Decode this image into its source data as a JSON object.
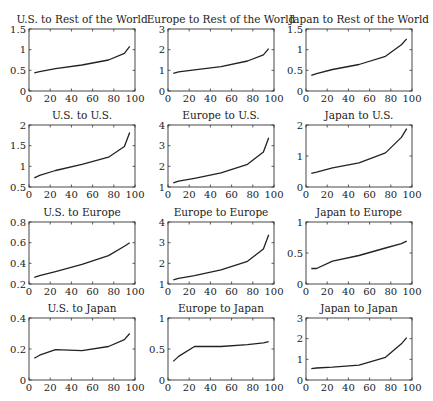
{
  "figure": {
    "layout": {
      "rows": 4,
      "cols": 3
    },
    "colors": {
      "line": "#222222",
      "axes": "#333333",
      "background": "#ffffff"
    }
  },
  "chart_data": [
    {
      "type": "line",
      "title": "U.S. to Rest of the World",
      "xlabel": "",
      "ylabel": "",
      "xlim": [
        0,
        100
      ],
      "ylim": [
        0,
        1.5
      ],
      "xticks": [
        0,
        20,
        40,
        60,
        80,
        100
      ],
      "yticks": [
        0,
        0.5,
        1,
        1.5
      ],
      "ytick_labels": [
        "0",
        "0.5",
        "1",
        "1.5"
      ],
      "grid": false,
      "x": [
        5,
        10,
        25,
        50,
        75,
        90,
        95
      ],
      "y": [
        0.44,
        0.47,
        0.54,
        0.63,
        0.75,
        0.91,
        1.08
      ]
    },
    {
      "type": "line",
      "title": "Europe to Rest of the World",
      "xlabel": "",
      "ylabel": "",
      "xlim": [
        0,
        100
      ],
      "ylim": [
        0,
        3
      ],
      "xticks": [
        0,
        20,
        40,
        60,
        80,
        100
      ],
      "yticks": [
        0,
        1,
        2,
        3
      ],
      "ytick_labels": [
        "0",
        "1",
        "2",
        "3"
      ],
      "grid": false,
      "x": [
        5,
        10,
        25,
        50,
        75,
        90,
        95
      ],
      "y": [
        0.85,
        0.93,
        1.02,
        1.18,
        1.45,
        1.75,
        2.05
      ]
    },
    {
      "type": "line",
      "title": "Japan to Rest of the World",
      "xlabel": "",
      "ylabel": "",
      "xlim": [
        0,
        100
      ],
      "ylim": [
        0,
        1.5
      ],
      "xticks": [
        0,
        20,
        40,
        60,
        80,
        100
      ],
      "yticks": [
        0,
        0.5,
        1,
        1.5
      ],
      "ytick_labels": [
        "0",
        "0.5",
        "1",
        "1.5"
      ],
      "grid": false,
      "x": [
        5,
        10,
        25,
        50,
        75,
        90,
        95
      ],
      "y": [
        0.38,
        0.42,
        0.52,
        0.64,
        0.84,
        1.12,
        1.26
      ]
    },
    {
      "type": "line",
      "title": "U.S. to U.S.",
      "xlabel": "",
      "ylabel": "",
      "xlim": [
        0,
        100
      ],
      "ylim": [
        0.5,
        2
      ],
      "xticks": [
        0,
        20,
        40,
        60,
        80,
        100
      ],
      "yticks": [
        0.5,
        1,
        1.5,
        2
      ],
      "ytick_labels": [
        "0.5",
        "1",
        "1.5",
        "2"
      ],
      "grid": false,
      "x": [
        5,
        10,
        25,
        50,
        75,
        90,
        95
      ],
      "y": [
        0.72,
        0.78,
        0.9,
        1.05,
        1.22,
        1.48,
        1.82
      ]
    },
    {
      "type": "line",
      "title": "Europe to U.S.",
      "xlabel": "",
      "ylabel": "",
      "xlim": [
        0,
        100
      ],
      "ylim": [
        1,
        4
      ],
      "xticks": [
        0,
        20,
        40,
        60,
        80,
        100
      ],
      "yticks": [
        1,
        2,
        3,
        4
      ],
      "ytick_labels": [
        "1",
        "2",
        "3",
        "4"
      ],
      "grid": false,
      "x": [
        5,
        10,
        25,
        50,
        75,
        90,
        95
      ],
      "y": [
        1.2,
        1.28,
        1.42,
        1.68,
        2.1,
        2.7,
        3.38
      ]
    },
    {
      "type": "line",
      "title": "Japan to U.S.",
      "xlabel": "",
      "ylabel": "",
      "xlim": [
        0,
        100
      ],
      "ylim": [
        0,
        2
      ],
      "xticks": [
        0,
        20,
        40,
        60,
        80,
        100
      ],
      "yticks": [
        0,
        1,
        2
      ],
      "ytick_labels": [
        "0",
        "1",
        "2"
      ],
      "grid": false,
      "x": [
        5,
        10,
        25,
        50,
        75,
        90,
        95
      ],
      "y": [
        0.44,
        0.48,
        0.62,
        0.78,
        1.1,
        1.6,
        1.88
      ]
    },
    {
      "type": "line",
      "title": "U.S. to Europe",
      "xlabel": "",
      "ylabel": "",
      "xlim": [
        0,
        100
      ],
      "ylim": [
        0.2,
        0.8
      ],
      "xticks": [
        0,
        20,
        40,
        60,
        80,
        100
      ],
      "yticks": [
        0.2,
        0.4,
        0.6,
        0.8
      ],
      "ytick_labels": [
        "0.2",
        "0.4",
        "0.6",
        "0.8"
      ],
      "grid": false,
      "x": [
        5,
        10,
        25,
        50,
        75,
        90,
        95
      ],
      "y": [
        0.265,
        0.28,
        0.32,
        0.39,
        0.475,
        0.565,
        0.6
      ]
    },
    {
      "type": "line",
      "title": "Europe to Europe",
      "xlabel": "",
      "ylabel": "",
      "xlim": [
        0,
        100
      ],
      "ylim": [
        1,
        4
      ],
      "xticks": [
        0,
        20,
        40,
        60,
        80,
        100
      ],
      "yticks": [
        1,
        2,
        3,
        4
      ],
      "ytick_labels": [
        "1",
        "2",
        "3",
        "4"
      ],
      "grid": false,
      "x": [
        5,
        10,
        25,
        50,
        75,
        90,
        95
      ],
      "y": [
        1.2,
        1.27,
        1.4,
        1.68,
        2.1,
        2.7,
        3.38
      ]
    },
    {
      "type": "line",
      "title": "Japan to Europe",
      "xlabel": "",
      "ylabel": "",
      "xlim": [
        0,
        100
      ],
      "ylim": [
        0,
        1
      ],
      "xticks": [
        0,
        20,
        40,
        60,
        80,
        100
      ],
      "yticks": [
        0,
        0.5,
        1
      ],
      "ytick_labels": [
        "0",
        "0.5",
        "1"
      ],
      "grid": false,
      "x": [
        5,
        10,
        25,
        50,
        75,
        90,
        95
      ],
      "y": [
        0.25,
        0.25,
        0.37,
        0.46,
        0.58,
        0.65,
        0.69
      ]
    },
    {
      "type": "line",
      "title": "U.S. to Japan",
      "xlabel": "",
      "ylabel": "",
      "xlim": [
        0,
        100
      ],
      "ylim": [
        0,
        0.4
      ],
      "xticks": [
        0,
        20,
        40,
        60,
        80,
        100
      ],
      "yticks": [
        0,
        0.2,
        0.4
      ],
      "ytick_labels": [
        "0",
        "0.2",
        "0.4"
      ],
      "grid": false,
      "x": [
        5,
        10,
        25,
        50,
        75,
        90,
        95
      ],
      "y": [
        0.14,
        0.16,
        0.196,
        0.19,
        0.216,
        0.26,
        0.3
      ]
    },
    {
      "type": "line",
      "title": "Europe to Japan",
      "xlabel": "",
      "ylabel": "",
      "xlim": [
        0,
        100
      ],
      "ylim": [
        0,
        1
      ],
      "xticks": [
        0,
        20,
        40,
        60,
        80,
        100
      ],
      "yticks": [
        0,
        0.5,
        1
      ],
      "ytick_labels": [
        "0",
        "0.5",
        "1"
      ],
      "grid": false,
      "x": [
        5,
        10,
        25,
        50,
        75,
        90,
        95
      ],
      "y": [
        0.3,
        0.38,
        0.54,
        0.54,
        0.57,
        0.6,
        0.62
      ]
    },
    {
      "type": "line",
      "title": "Japan to Japan",
      "xlabel": "",
      "ylabel": "",
      "xlim": [
        0,
        100
      ],
      "ylim": [
        0,
        3
      ],
      "xticks": [
        0,
        20,
        40,
        60,
        80,
        100
      ],
      "yticks": [
        0,
        1,
        2,
        3
      ],
      "ytick_labels": [
        "0",
        "1",
        "2",
        "3"
      ],
      "grid": false,
      "x": [
        5,
        10,
        25,
        50,
        75,
        90,
        95
      ],
      "y": [
        0.55,
        0.58,
        0.62,
        0.72,
        1.1,
        1.75,
        2.05
      ]
    }
  ]
}
